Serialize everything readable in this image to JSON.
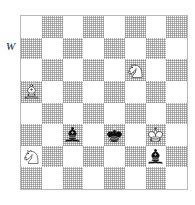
{
  "diagram": {
    "type": "chess-position",
    "side_to_move_label": "W",
    "board": {
      "files": 8,
      "ranks": 8,
      "light_square_color": "#ffffff",
      "dark_square_color": "#bdbdbd",
      "border_color": "#b9b9b9",
      "orientation": "white-bottom"
    },
    "pieces": [
      {
        "name": "white-knight",
        "color": "white",
        "type": "knight",
        "row": 2,
        "col": 5,
        "square": "f6",
        "square_shade": "light"
      },
      {
        "name": "white-bishop",
        "color": "white",
        "type": "bishop",
        "row": 3,
        "col": 0,
        "square": "a5",
        "square_shade": "dark"
      },
      {
        "name": "black-bishop-c3",
        "color": "black",
        "type": "bishop",
        "row": 5,
        "col": 2,
        "square": "c3",
        "square_shade": "dark"
      },
      {
        "name": "black-king",
        "color": "black",
        "type": "king",
        "row": 5,
        "col": 4,
        "square": "e3",
        "square_shade": "dark"
      },
      {
        "name": "white-king",
        "color": "white",
        "type": "king",
        "row": 5,
        "col": 6,
        "square": "g3",
        "square_shade": "dark"
      },
      {
        "name": "white-knight-a2",
        "color": "white",
        "type": "knight",
        "row": 6,
        "col": 0,
        "square": "a2",
        "square_shade": "dark"
      },
      {
        "name": "black-bishop-g2",
        "color": "black",
        "type": "bishop",
        "row": 6,
        "col": 6,
        "square": "g2",
        "square_shade": "light"
      }
    ]
  }
}
